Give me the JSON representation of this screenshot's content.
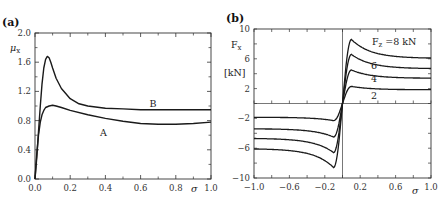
{
  "chart_data": [
    {
      "type": "line",
      "panel_label": "(a)",
      "title": "",
      "xlabel": "σ",
      "ylabel": "μ",
      "ylabel_sub": "x",
      "xlim": [
        0.0,
        1.0
      ],
      "ylim": [
        0.0,
        2.0
      ],
      "xticks": [
        "0.0",
        "0.2",
        "0.4",
        "0.6",
        "0.8",
        "1.0"
      ],
      "yticks": [
        "0.0",
        "0.4",
        "0.8",
        "1.2",
        "1.6",
        "2.0"
      ],
      "grid": false,
      "series": [
        {
          "name": "A",
          "label_pos": [
            0.38,
            0.75
          ],
          "x": [
            0,
            0.01,
            0.02,
            0.03,
            0.04,
            0.05,
            0.06,
            0.08,
            0.1,
            0.12,
            0.15,
            0.2,
            0.3,
            0.4,
            0.5,
            0.6,
            0.7,
            0.8,
            0.9,
            1.0
          ],
          "y": [
            0,
            0.35,
            0.6,
            0.78,
            0.88,
            0.94,
            0.98,
            1.0,
            1.01,
            1.0,
            0.98,
            0.94,
            0.88,
            0.83,
            0.79,
            0.76,
            0.75,
            0.75,
            0.76,
            0.78
          ]
        },
        {
          "name": "B",
          "label_pos": [
            0.65,
            0.99
          ],
          "x": [
            0,
            0.01,
            0.02,
            0.03,
            0.04,
            0.05,
            0.06,
            0.07,
            0.08,
            0.09,
            0.1,
            0.12,
            0.15,
            0.2,
            0.25,
            0.3,
            0.4,
            0.5,
            0.6,
            0.7,
            0.8,
            0.9,
            1.0
          ],
          "y": [
            0,
            0.3,
            0.65,
            1.0,
            1.3,
            1.52,
            1.64,
            1.68,
            1.66,
            1.6,
            1.52,
            1.38,
            1.24,
            1.1,
            1.03,
            1.0,
            0.97,
            0.96,
            0.95,
            0.95,
            0.95,
            0.95,
            0.95
          ]
        }
      ]
    },
    {
      "type": "line",
      "panel_label": "(b)",
      "title": "",
      "xlabel": "σ",
      "ylabel": "F",
      "ylabel_sub": "x",
      "yunit": "[kN]",
      "xlim": [
        -1.0,
        1.0
      ],
      "ylim": [
        -10,
        10
      ],
      "xticks": [
        "-1.0",
        "-0.6",
        "-0.2",
        "0.2",
        "0.6",
        "1.0"
      ],
      "yticks": [
        "-10",
        "-6",
        "-2",
        "2",
        "6",
        "10"
      ],
      "grid": false,
      "legend_annotation": "F  =8  kN",
      "legend_sub": "z",
      "series": [
        {
          "name": "2",
          "Fz": 2,
          "peak": 2.3,
          "tail": 1.85,
          "label_pos": [
            0.3,
            0.8
          ]
        },
        {
          "name": "4",
          "Fz": 4,
          "peak": 4.5,
          "tail": 3.4,
          "label_pos": [
            0.3,
            3.0
          ]
        },
        {
          "name": "6",
          "Fz": 6,
          "peak": 6.6,
          "tail": 4.7,
          "label_pos": [
            0.3,
            4.8
          ]
        },
        {
          "name": "8",
          "Fz": 8,
          "peak": 8.6,
          "tail": 6.1,
          "label_pos": null
        }
      ]
    }
  ]
}
